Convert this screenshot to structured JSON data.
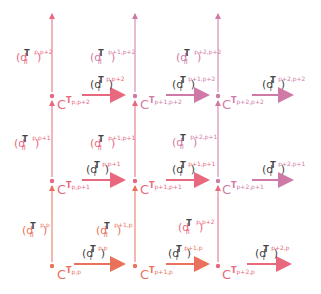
{
  "colors": {
    "row0": "#e8725c",
    "row1": "#e8687e",
    "row2": "#cf7aa6",
    "text": "#444444"
  },
  "nodes": [
    {
      "id": "p,p",
      "label": "C",
      "sup": "T",
      "idx": "p,p",
      "x": 52,
      "y": 266,
      "row": 0
    },
    {
      "id": "p+1,p",
      "label": "C",
      "sup": "T",
      "idx": "p+1,p",
      "x": 135,
      "y": 266,
      "row": 0
    },
    {
      "id": "p+2,p",
      "label": "C",
      "sup": "T",
      "idx": "p+2,p",
      "x": 218,
      "y": 266,
      "row": 0
    },
    {
      "id": "p,p+1",
      "label": "C",
      "sup": "T",
      "idx": "p,p+1",
      "x": 52,
      "y": 181,
      "row": 1
    },
    {
      "id": "p+1,p+1",
      "label": "C",
      "sup": "T",
      "idx": "p+1,p+1",
      "x": 135,
      "y": 181,
      "row": 1
    },
    {
      "id": "p+2,p+1",
      "label": "C",
      "sup": "T",
      "idx": "p+2,p+1",
      "x": 218,
      "y": 181,
      "row": 1
    },
    {
      "id": "p,p+2",
      "label": "C",
      "sup": "T",
      "idx": "p,p+2",
      "x": 52,
      "y": 96,
      "row": 2
    },
    {
      "id": "p+1,p+2",
      "label": "C",
      "sup": "T",
      "idx": "p+1,p+2",
      "x": 135,
      "y": 96,
      "row": 2
    },
    {
      "id": "p+2,p+2",
      "label": "C",
      "sup": "T",
      "idx": "p+2,p+2",
      "x": 218,
      "y": 96,
      "row": 2
    }
  ],
  "horizontal_maps": [
    {
      "op": "d",
      "sub": "I",
      "sup": "T",
      "idx": "p,p",
      "row": 0
    },
    {
      "op": "d",
      "sub": "I",
      "sup": "T",
      "idx": "p+1,p",
      "row": 0
    },
    {
      "op": "d",
      "sub": "I",
      "sup": "T",
      "idx": "p+2,p",
      "row": 0
    },
    {
      "op": "d",
      "sub": "I",
      "sup": "T",
      "idx": "p,p+1",
      "row": 1
    },
    {
      "op": "d",
      "sub": "I",
      "sup": "T",
      "idx": "p+1,p+1",
      "row": 1
    },
    {
      "op": "d",
      "sub": "I",
      "sup": "T",
      "idx": "p+2,p+1",
      "row": 1
    },
    {
      "op": "d",
      "sub": "I",
      "sup": "T",
      "idx": "p,p+2",
      "row": 2
    },
    {
      "op": "d",
      "sub": "I",
      "sup": "T",
      "idx": "p+1,p+2",
      "row": 2
    },
    {
      "op": "d",
      "sub": "I",
      "sup": "T",
      "idx": "p+2,p+2",
      "row": 2
    }
  ],
  "vertical_maps": [
    {
      "op": "d",
      "sub": "II",
      "sup": "T",
      "idx": "p,p"
    },
    {
      "op": "d",
      "sub": "II",
      "sup": "T",
      "idx": "p+1,p"
    },
    {
      "op": "d",
      "sub": "II",
      "sup": "T",
      "idx": "p,p+2"
    },
    {
      "op": "d",
      "sub": "II",
      "sup": "T",
      "idx": "p,p+1"
    },
    {
      "op": "d",
      "sub": "II",
      "sup": "T",
      "idx": "p+1,p+1"
    },
    {
      "op": "d",
      "sub": "II",
      "sup": "T",
      "idx": "p+2,p+1"
    },
    {
      "op": "d",
      "sub": "II",
      "sup": "T",
      "idx": "p,p+2"
    },
    {
      "op": "d",
      "sub": "II",
      "sup": "T",
      "idx": "p+1,p+2"
    },
    {
      "op": "d",
      "sub": "II",
      "sup": "T",
      "idx": "p+2,p+2"
    }
  ]
}
